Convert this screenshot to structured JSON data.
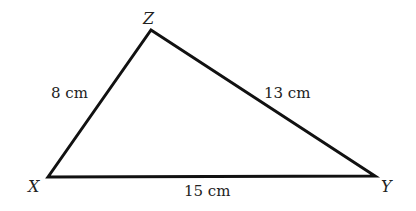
{
  "diagram": {
    "type": "triangle",
    "stroke_color": "#111111",
    "background": "#ffffff",
    "vertices": [
      {
        "name": "X",
        "label": "X",
        "x": 48,
        "y": 177
      },
      {
        "name": "Y",
        "label": "Y",
        "x": 375,
        "y": 176
      },
      {
        "name": "Z",
        "label": "Z",
        "x": 151,
        "y": 30
      }
    ],
    "sides": [
      {
        "from": "X",
        "to": "Z",
        "label": "8 cm"
      },
      {
        "from": "Z",
        "to": "Y",
        "label": "13 cm"
      },
      {
        "from": "X",
        "to": "Y",
        "label": "15 cm"
      }
    ]
  }
}
